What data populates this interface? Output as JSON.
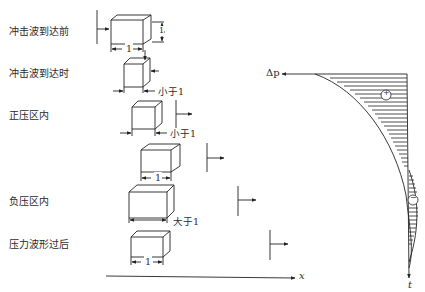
{
  "stages": [
    {
      "label": "冲击波到达前",
      "dimension": "1"
    },
    {
      "label": "冲击波到达时",
      "dimension": "小于1"
    },
    {
      "label": "正压区内",
      "dimension": "小于1"
    },
    {
      "label": "",
      "dimension": "1"
    },
    {
      "label": "负压区内",
      "dimension": "大于1"
    },
    {
      "label": "压力波形过后",
      "dimension": "1"
    }
  ],
  "side_dimension": "1",
  "axes": {
    "x_label": "x",
    "time_label": "t",
    "pressure_label": "Δp"
  },
  "regions": {
    "positive": "+",
    "negative": "−"
  }
}
